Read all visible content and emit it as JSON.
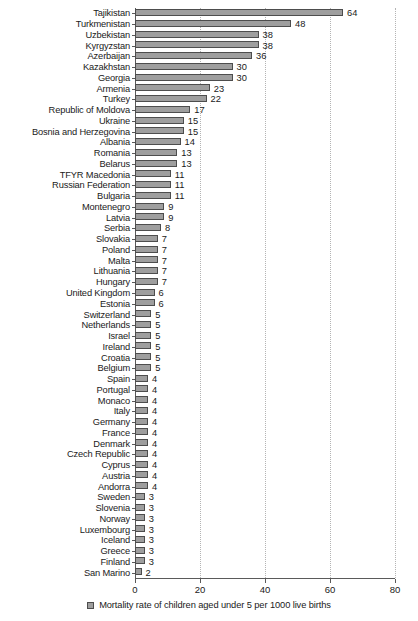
{
  "chart_data": {
    "type": "bar",
    "orientation": "horizontal",
    "title": "",
    "xlabel": "",
    "ylabel": "",
    "xlim": [
      0,
      80
    ],
    "xticks": [
      0,
      20,
      40,
      60,
      80
    ],
    "grid": true,
    "legend_position": "bottom",
    "legend": [
      "Mortality rate of children aged under 5 per 1000 live births"
    ],
    "series_name": "Mortality rate of children aged under 5 per 1000 live births",
    "categories": [
      "Tajikistan",
      "Turkmenistan",
      "Uzbekistan",
      "Kyrgyzstan",
      "Azerbaijan",
      "Kazakhstan",
      "Georgia",
      "Armenia",
      "Turkey",
      "Republic of Moldova",
      "Ukraine",
      "Bosnia and Herzegovina",
      "Albania",
      "Romania",
      "Belarus",
      "TFYR Macedonia",
      "Russian Federation",
      "Bulgaria",
      "Montenegro",
      "Latvia",
      "Serbia",
      "Slovakia",
      "Poland",
      "Malta",
      "Lithuania",
      "Hungary",
      "United Kingdom",
      "Estonia",
      "Switzerland",
      "Netherlands",
      "Israel",
      "Ireland",
      "Croatia",
      "Belgium",
      "Spain",
      "Portugal",
      "Monaco",
      "Italy",
      "Germany",
      "France",
      "Denmark",
      "Czech Republic",
      "Cyprus",
      "Austria",
      "Andorra",
      "Sweden",
      "Slovenia",
      "Norway",
      "Luxembourg",
      "Iceland",
      "Greece",
      "Finland",
      "San Marino"
    ],
    "values": [
      64,
      48,
      38,
      38,
      36,
      30,
      30,
      23,
      22,
      17,
      15,
      15,
      14,
      13,
      13,
      11,
      11,
      11,
      9,
      9,
      8,
      7,
      7,
      7,
      7,
      7,
      6,
      6,
      5,
      5,
      5,
      5,
      5,
      5,
      4,
      4,
      4,
      4,
      4,
      4,
      4,
      4,
      4,
      4,
      4,
      3,
      3,
      3,
      3,
      3,
      3,
      3,
      2
    ]
  },
  "colors": {
    "bar_fill": "#9e9e9e",
    "bar_border": "#4d4d4d",
    "axis": "#5a5a5a",
    "gridline": "#b4b4b4",
    "text": "#1a1a1a",
    "background": "#ffffff"
  },
  "legend": {
    "label": "Mortality rate of children aged under 5 per 1000 live births",
    "marker": "square-marker"
  }
}
